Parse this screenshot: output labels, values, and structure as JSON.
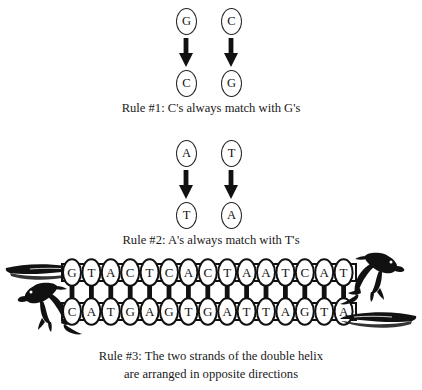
{
  "figure": {
    "background_color": "#ffffff",
    "ink_color": "#1a1a1a"
  },
  "rule1": {
    "id": "rule-1",
    "caption": "Rule #1: C's always match with G's",
    "columns": [
      {
        "from": "G",
        "to": "C",
        "arrow": "down-arrow-icon"
      },
      {
        "from": "C",
        "to": "G",
        "arrow": "down-arrow-icon"
      }
    ]
  },
  "rule2": {
    "id": "rule-2",
    "caption": "Rule #2: A's always match with T's",
    "columns": [
      {
        "from": "A",
        "to": "T",
        "arrow": "down-arrow-icon"
      },
      {
        "from": "T",
        "to": "A",
        "arrow": "down-arrow-icon"
      }
    ]
  },
  "rule3": {
    "id": "rule-3",
    "caption_line1": "Rule #3: The two strands of the double helix",
    "caption_line2": "are arranged in opposite directions"
  },
  "helix": {
    "base_count": 15,
    "top_strand": {
      "label": "top-strand",
      "sequence": [
        "G",
        "T",
        "A",
        "C",
        "T",
        "C",
        "A",
        "C",
        "T",
        "A",
        "A",
        "T",
        "C",
        "A",
        "T"
      ],
      "sequence_text": "GTACTCACTAATCAT",
      "direction": "left-to-right"
    },
    "bottom_strand": {
      "label": "bottom-strand",
      "sequence": [
        "C",
        "A",
        "T",
        "G",
        "A",
        "G",
        "T",
        "G",
        "A",
        "T",
        "T",
        "A",
        "G",
        "T",
        "A"
      ],
      "sequence_text": "CATGAGTGATTAGTA",
      "direction": "right-to-left"
    },
    "creatures": [
      {
        "name": "raptor-tail-left-top",
        "side": "left",
        "part": "tail"
      },
      {
        "name": "raptor-head-left-bottom",
        "side": "left",
        "part": "head"
      },
      {
        "name": "raptor-head-right-top",
        "side": "right",
        "part": "head"
      },
      {
        "name": "raptor-tail-right-bottom",
        "side": "right",
        "part": "tail"
      }
    ]
  }
}
